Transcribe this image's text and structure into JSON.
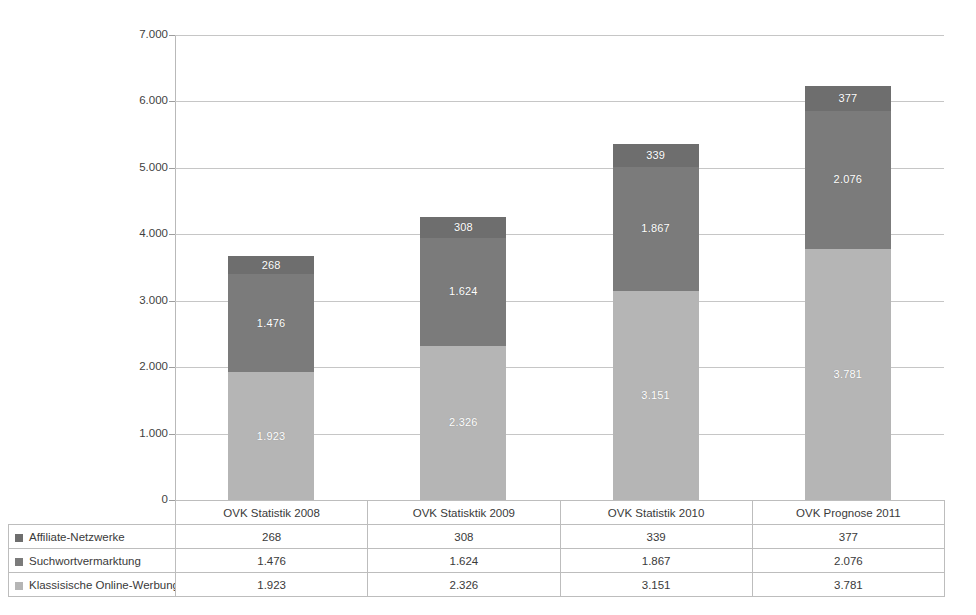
{
  "chart_data": {
    "type": "bar",
    "stacked": true,
    "title": "",
    "subtitle": "",
    "xlabel": "",
    "ylabel": "",
    "ylim": [
      0,
      7000
    ],
    "ytick_step": 1000,
    "ytick_labels": [
      "7.000",
      "6.000",
      "5.000",
      "4.000",
      "3.000",
      "2.000",
      "1.000",
      "0"
    ],
    "ytick_values": [
      7000,
      6000,
      5000,
      4000,
      3000,
      2000,
      1000,
      0
    ],
    "grid": true,
    "legend_position": "data-table-left",
    "number_format": "de-DE",
    "categories": [
      "OVK Statistik  2008",
      "OVK Statisktik 2009",
      "OVK Statistik 2010",
      "OVK Prognose 2011"
    ],
    "series": [
      {
        "name": "Affiliate-Netzwerke",
        "color": "#6e6e6e",
        "stack_order": 3,
        "values": [
          268,
          308,
          339,
          377
        ],
        "labels": [
          "268",
          "308",
          "339",
          "377"
        ]
      },
      {
        "name": "Suchwortvermarktung",
        "color": "#7b7b7b",
        "stack_order": 2,
        "values": [
          1476,
          1624,
          1867,
          2076
        ],
        "labels": [
          "1.476",
          "1.624",
          "1.867",
          "2.076"
        ]
      },
      {
        "name": "Klassisische Online-Werbung",
        "color": "#b5b5b5",
        "stack_order": 1,
        "values": [
          1923,
          2326,
          3151,
          3781
        ],
        "labels": [
          "1.923",
          "2.326",
          "3.151",
          "3.781"
        ]
      }
    ],
    "totals": [
      3667,
      4258,
      5357,
      6234
    ]
  },
  "table": {
    "corner_label": "",
    "header_row": [
      "OVK Statistik  2008",
      "OVK Statisktik 2009",
      "OVK Statistik 2010",
      "OVK Prognose 2011"
    ],
    "rows": [
      {
        "label": "Affiliate-Netzwerke",
        "swatch_color": "#6e6e6e",
        "values": [
          "268",
          "308",
          "339",
          "377"
        ]
      },
      {
        "label": "Suchwortvermarktung",
        "swatch_color": "#7b7b7b",
        "values": [
          "1.476",
          "1.624",
          "1.867",
          "2.076"
        ]
      },
      {
        "label": "Klassisische Online-Werbung",
        "swatch_color": "#b5b5b5",
        "values": [
          "1.923",
          "2.326",
          "3.151",
          "3.781"
        ]
      }
    ]
  },
  "colors": {
    "background": "#ffffff",
    "gridline": "#c6c6c6",
    "axis": "#9d9d9d",
    "table_border": "#bdbdbd",
    "text": "#3a3a3a",
    "bar_label_text": "#ffffff"
  }
}
